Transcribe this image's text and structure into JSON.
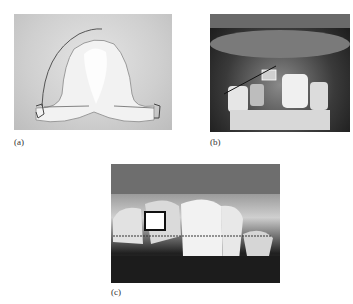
{
  "figure": {
    "panels": [
      {
        "id": "a",
        "label": "(a)",
        "description": "Removable orthodontic appliance with acrylic base and wire clasps"
      },
      {
        "id": "b",
        "label": "(b)",
        "description": "Intraoral view of anterior teeth with bracket and wire"
      },
      {
        "id": "c",
        "label": "(c)",
        "description": "Close-up of upper incisors with bracket and ligature wire"
      }
    ]
  }
}
